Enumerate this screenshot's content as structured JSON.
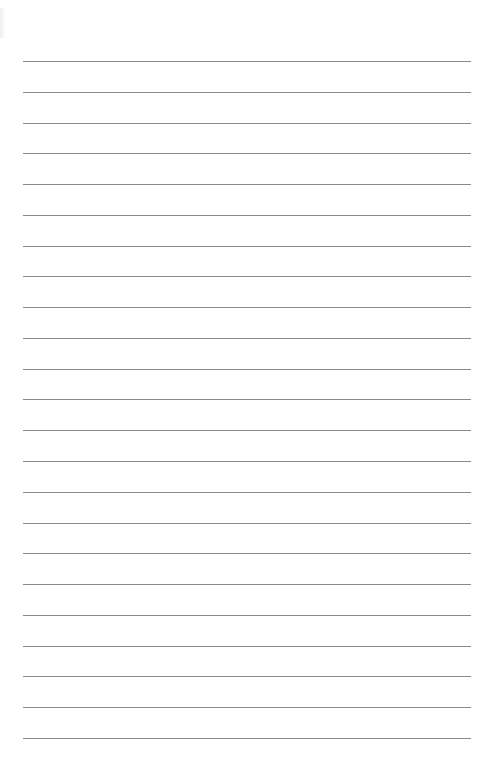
{
  "page": {
    "type": "lined-paper",
    "line_color": "#8a8a8a",
    "background": "#ffffff",
    "line_count": 23,
    "first_line_y": 61,
    "line_spacing": 30.77,
    "line_left": 23,
    "line_width": 448
  }
}
